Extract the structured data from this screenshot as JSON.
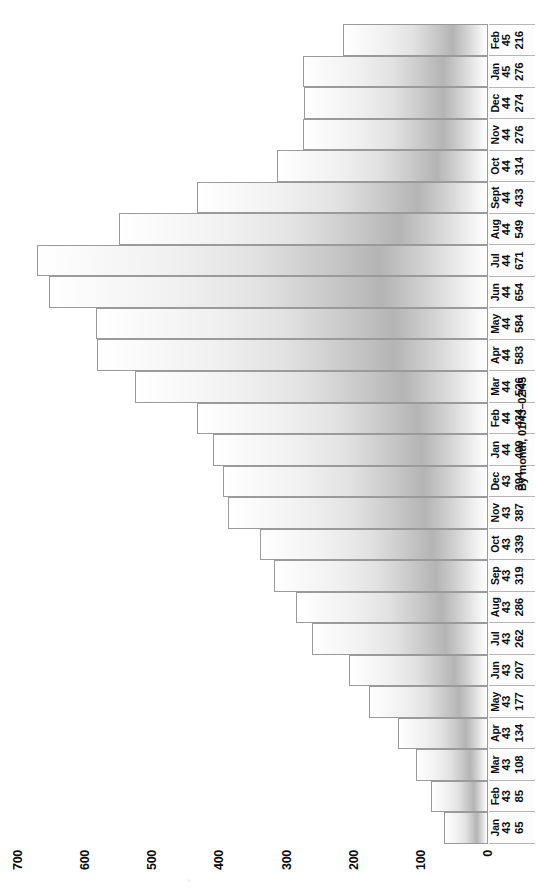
{
  "chart_data": {
    "type": "bar",
    "orientation": "vertical-in-source-rotated-90ccw",
    "title": "",
    "caption": "By month, 01/43–02/45",
    "xlabel": "",
    "ylabel": "",
    "ylim": [
      0,
      700
    ],
    "grid": false,
    "legend": null,
    "yticks": [
      "0",
      "100",
      "200",
      "300",
      "400",
      "500",
      "600",
      "700"
    ],
    "ytick_values": [
      0,
      100,
      200,
      300,
      400,
      500,
      600,
      700
    ],
    "categories": [
      "Jan 43",
      "Feb 43",
      "Mar 43",
      "Apr 43",
      "May 43",
      "Jun 43",
      "Jul 43",
      "Aug 43",
      "Sep 43",
      "Oct 43",
      "Nov 43",
      "Dec 43",
      "Jan 44",
      "Feb 44",
      "Mar 44",
      "Apr 44",
      "May 44",
      "Jun 44",
      "Jul 44",
      "Aug 44",
      "Sept 44",
      "Oct 44",
      "Nov 44",
      "Dec 44",
      "Jan 45",
      "Feb 45"
    ],
    "values": [
      65,
      85,
      108,
      134,
      177,
      207,
      262,
      286,
      319,
      339,
      387,
      394,
      409,
      434,
      526,
      583,
      584,
      654,
      671,
      549,
      433,
      314,
      276,
      274,
      276,
      216
    ],
    "points": [
      {
        "month": "Jan",
        "year": "43",
        "value": "65"
      },
      {
        "month": "Feb",
        "year": "43",
        "value": "85"
      },
      {
        "month": "Mar",
        "year": "43",
        "value": "108"
      },
      {
        "month": "Apr",
        "year": "43",
        "value": "134"
      },
      {
        "month": "May",
        "year": "43",
        "value": "177"
      },
      {
        "month": "Jun",
        "year": "43",
        "value": "207"
      },
      {
        "month": "Jul",
        "year": "43",
        "value": "262"
      },
      {
        "month": "Aug",
        "year": "43",
        "value": "286"
      },
      {
        "month": "Sep",
        "year": "43",
        "value": "319"
      },
      {
        "month": "Oct",
        "year": "43",
        "value": "339"
      },
      {
        "month": "Nov",
        "year": "43",
        "value": "387"
      },
      {
        "month": "Dec",
        "year": "43",
        "value": "394"
      },
      {
        "month": "Jan",
        "year": "44",
        "value": "409"
      },
      {
        "month": "Feb",
        "year": "44",
        "value": "434"
      },
      {
        "month": "Mar",
        "year": "44",
        "value": "526"
      },
      {
        "month": "Apr",
        "year": "44",
        "value": "583"
      },
      {
        "month": "May",
        "year": "44",
        "value": "584"
      },
      {
        "month": "Jun",
        "year": "44",
        "value": "654"
      },
      {
        "month": "Jul",
        "year": "44",
        "value": "671"
      },
      {
        "month": "Aug",
        "year": "44",
        "value": "549"
      },
      {
        "month": "Sept",
        "year": "44",
        "value": "433"
      },
      {
        "month": "Oct",
        "year": "44",
        "value": "314"
      },
      {
        "month": "Nov",
        "year": "44",
        "value": "276"
      },
      {
        "month": "Dec",
        "year": "44",
        "value": "274"
      },
      {
        "month": "Jan",
        "year": "45",
        "value": "276"
      },
      {
        "month": "Feb",
        "year": "45",
        "value": "216"
      }
    ]
  },
  "colors": {
    "page_background": "#ffffff",
    "bar_outline": "#9a9a9a",
    "bar_light": "#ffffff",
    "bar_dark": "#b4b4b4",
    "label_cell_border": "#b5b5b5",
    "text": "#0d0d0d"
  }
}
